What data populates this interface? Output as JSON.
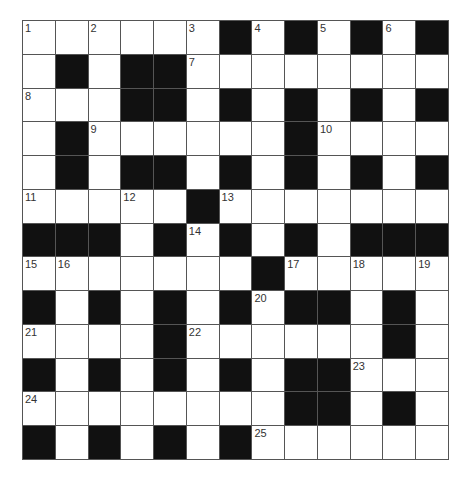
{
  "puzzle": {
    "rows": 13,
    "cols": 13,
    "colors": {
      "block": "#111111",
      "cell": "#ffffff",
      "line": "#555555",
      "number": "#333333"
    },
    "layout": [
      "WWWWWWBWBWBWB",
      "WBWBBWWWWWWWW",
      "WWWBBWBWBWBWB",
      "WBWWWWWWBWWWW",
      "WBWBBWBWBWBWB",
      "WWWWWBWWWWWWW",
      "BBBWBWBWBWBBB",
      "WWWWWWWBWWWWW",
      "BWBWBWBWBBWBW",
      "WWWWBWWWWWWBW",
      "BWBWBWBWBBWWW",
      "WWWWWWWWBBWBW",
      "BWBWBWBWWWWWW"
    ],
    "numbers": [
      {
        "row": 0,
        "col": 0,
        "label": "1"
      },
      {
        "row": 0,
        "col": 2,
        "label": "2"
      },
      {
        "row": 0,
        "col": 5,
        "label": "3"
      },
      {
        "row": 0,
        "col": 7,
        "label": "4"
      },
      {
        "row": 0,
        "col": 9,
        "label": "5"
      },
      {
        "row": 0,
        "col": 11,
        "label": "6"
      },
      {
        "row": 1,
        "col": 5,
        "label": "7"
      },
      {
        "row": 2,
        "col": 0,
        "label": "8"
      },
      {
        "row": 3,
        "col": 2,
        "label": "9"
      },
      {
        "row": 3,
        "col": 9,
        "label": "10"
      },
      {
        "row": 5,
        "col": 0,
        "label": "11"
      },
      {
        "row": 5,
        "col": 3,
        "label": "12"
      },
      {
        "row": 5,
        "col": 6,
        "label": "13"
      },
      {
        "row": 6,
        "col": 5,
        "label": "14"
      },
      {
        "row": 7,
        "col": 0,
        "label": "15"
      },
      {
        "row": 7,
        "col": 1,
        "label": "16"
      },
      {
        "row": 7,
        "col": 8,
        "label": "17"
      },
      {
        "row": 7,
        "col": 10,
        "label": "18"
      },
      {
        "row": 7,
        "col": 12,
        "label": "19"
      },
      {
        "row": 8,
        "col": 7,
        "label": "20"
      },
      {
        "row": 9,
        "col": 0,
        "label": "21"
      },
      {
        "row": 9,
        "col": 5,
        "label": "22"
      },
      {
        "row": 10,
        "col": 10,
        "label": "23"
      },
      {
        "row": 11,
        "col": 0,
        "label": "24"
      },
      {
        "row": 12,
        "col": 7,
        "label": "25"
      }
    ]
  }
}
